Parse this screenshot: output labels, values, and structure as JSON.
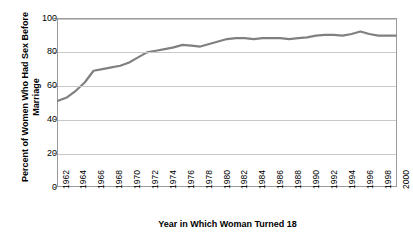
{
  "chart_data": {
    "type": "line",
    "title": "",
    "xlabel": "Year in Which Woman Turned 18",
    "ylabel": "Percent of Women Who Had Sex Before Marriage",
    "xlim": [
      1962,
      2000
    ],
    "ylim": [
      0,
      100
    ],
    "grid": true,
    "legend": "none",
    "line_color": "#808080",
    "x_tick_labels": [
      "1962",
      "1964",
      "1966",
      "1968",
      "1970",
      "1972",
      "1974",
      "1976",
      "1978",
      "1980",
      "1982",
      "1984",
      "1986",
      "1988",
      "1990",
      "1992",
      "1994",
      "1996",
      "1998",
      "2000"
    ],
    "y_tick_labels": [
      "0",
      "20",
      "40",
      "60",
      "80",
      "100"
    ],
    "y_ticks": [
      0,
      20,
      40,
      60,
      80,
      100
    ],
    "x": [
      1962,
      1963,
      1964,
      1965,
      1966,
      1967,
      1968,
      1969,
      1970,
      1971,
      1972,
      1973,
      1974,
      1975,
      1976,
      1977,
      1978,
      1979,
      1980,
      1981,
      1982,
      1983,
      1984,
      1985,
      1986,
      1987,
      1988,
      1989,
      1990,
      1991,
      1992,
      1993,
      1994,
      1995,
      1996,
      1997,
      1998,
      1999,
      2000
    ],
    "values": [
      51,
      53,
      57,
      62,
      69,
      70,
      71,
      72,
      74,
      77,
      80,
      81,
      82,
      83,
      84.5,
      84,
      83.5,
      85,
      86.5,
      88,
      88.5,
      88.5,
      88,
      88.5,
      88.5,
      88.5,
      88,
      88.5,
      89,
      90,
      90.5,
      90.5,
      90,
      91,
      92.5,
      91,
      90,
      90,
      90
    ]
  },
  "axis_titles": {
    "y": "Percent of Women Who Had Sex Before Marriage",
    "x": "Year in Which Woman Turned 18"
  }
}
